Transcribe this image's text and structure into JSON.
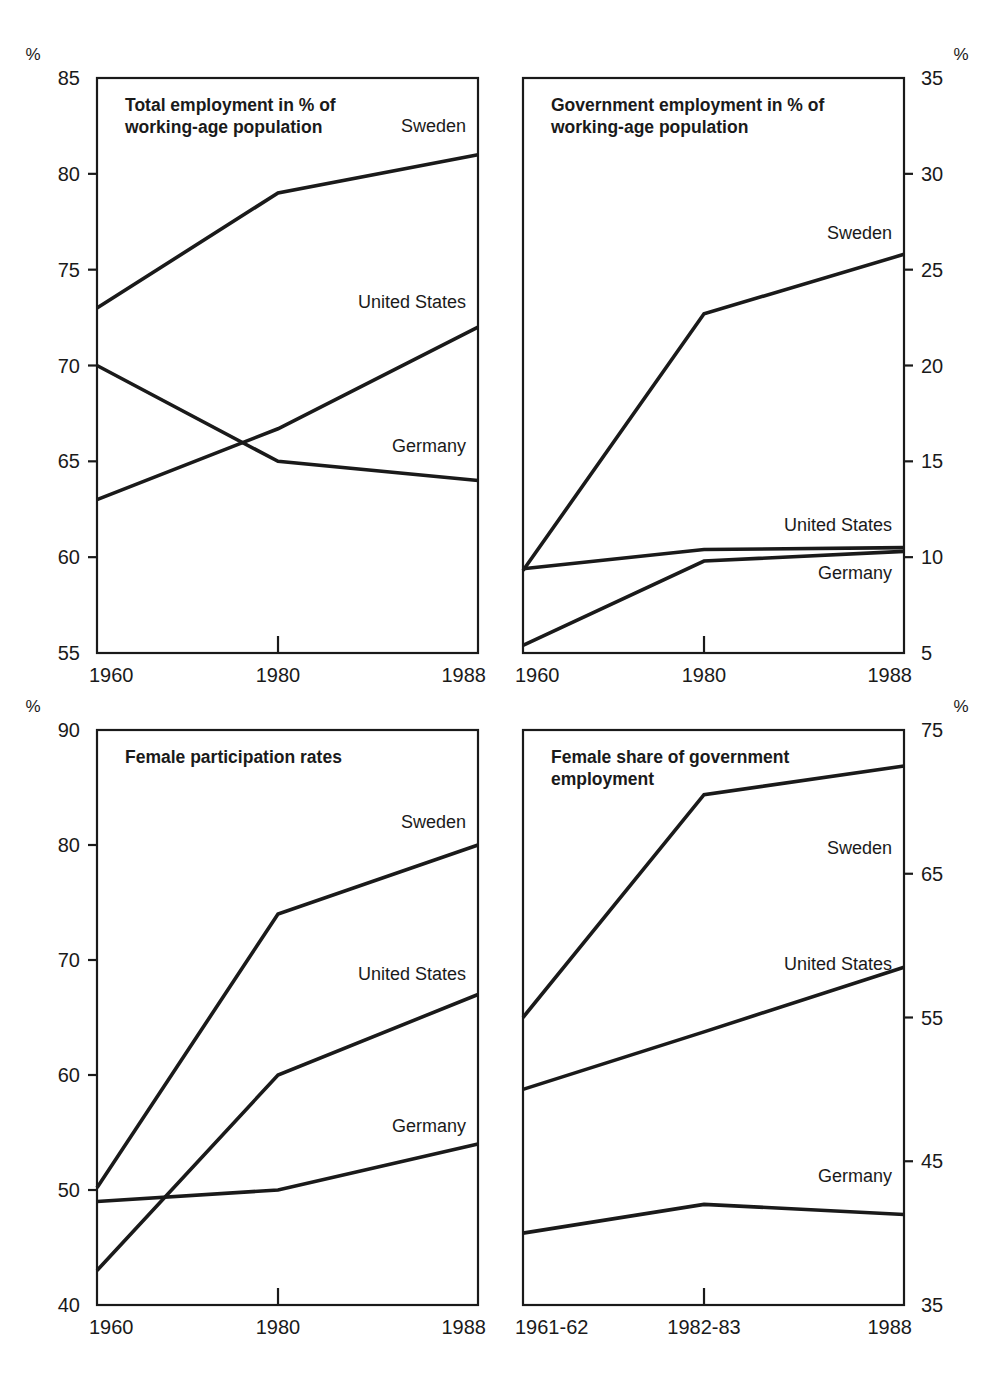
{
  "figure": {
    "series_names": [
      "Sweden",
      "United States",
      "Germany"
    ],
    "unit_symbol": "%",
    "line_color": "#1a1a1a"
  },
  "chart_data": [
    {
      "id": "total-employment",
      "type": "line",
      "title": "Total employment in % of working-age population",
      "title_lines": [
        "Total employment in % of",
        "working-age population"
      ],
      "xlabel": "",
      "ylabel": "%",
      "x": [
        "1960",
        "1980",
        "1988"
      ],
      "xtick_labels": [
        "1960",
        "1980",
        "1988"
      ],
      "ylim": [
        55,
        85
      ],
      "ytick_labels": [
        "55",
        "60",
        "65",
        "70",
        "75",
        "80",
        "85"
      ],
      "yticks": [
        55,
        60,
        65,
        70,
        75,
        80,
        85
      ],
      "grid": false,
      "legend": "inline-right",
      "series": [
        {
          "name": "Sweden",
          "values": [
            73.0,
            79.0,
            81.0
          ],
          "label_anchor_value": 82.5
        },
        {
          "name": "United States",
          "values": [
            63.0,
            66.7,
            72.0
          ],
          "label_anchor_value": 73.3
        },
        {
          "name": "Germany",
          "values": [
            70.0,
            65.0,
            64.0
          ],
          "label_anchor_value": 65.8
        }
      ]
    },
    {
      "id": "government-employment",
      "type": "line",
      "title": "Government employment in % of working-age population",
      "title_lines": [
        "Government employment in % of",
        "working-age population"
      ],
      "xlabel": "",
      "ylabel": "%",
      "x": [
        "1960",
        "1980",
        "1988"
      ],
      "xtick_labels": [
        "1960",
        "1980",
        "1988"
      ],
      "ylim": [
        5,
        35
      ],
      "ytick_labels": [
        "5",
        "10",
        "15",
        "20",
        "25",
        "30",
        "35"
      ],
      "yticks": [
        5,
        10,
        15,
        20,
        25,
        30,
        35
      ],
      "grid": false,
      "legend": "inline-right",
      "series": [
        {
          "name": "Sweden",
          "values": [
            9.3,
            22.7,
            25.8
          ],
          "label_anchor_value": 26.9
        },
        {
          "name": "United States",
          "values": [
            9.4,
            10.4,
            10.5
          ],
          "label_anchor_value": 11.7
        },
        {
          "name": "Germany",
          "values": [
            5.4,
            9.8,
            10.3
          ],
          "label_anchor_value": 9.2
        }
      ]
    },
    {
      "id": "female-participation",
      "type": "line",
      "title": "Female participation rates",
      "title_lines": [
        "Female participation rates"
      ],
      "xlabel": "",
      "ylabel": "%",
      "x": [
        "1960",
        "1980",
        "1988"
      ],
      "xtick_labels": [
        "1960",
        "1980",
        "1988"
      ],
      "ylim": [
        40,
        90
      ],
      "ytick_labels": [
        "40",
        "50",
        "60",
        "70",
        "80",
        "90"
      ],
      "yticks": [
        40,
        50,
        60,
        70,
        80,
        90
      ],
      "grid": false,
      "legend": "inline-right",
      "series": [
        {
          "name": "Sweden",
          "values": [
            50.2,
            74.0,
            80.0
          ],
          "label_anchor_value": 82.0
        },
        {
          "name": "United States",
          "values": [
            43.0,
            60.0,
            67.0
          ],
          "label_anchor_value": 68.8
        },
        {
          "name": "Germany",
          "values": [
            49.0,
            50.0,
            54.0
          ],
          "label_anchor_value": 55.6
        }
      ]
    },
    {
      "id": "female-share-government",
      "type": "line",
      "title": "Female share of government employment",
      "title_lines": [
        "Female share of government",
        "employment"
      ],
      "xlabel": "",
      "ylabel": "%",
      "x": [
        "1961-62",
        "1982-83",
        "1988"
      ],
      "xtick_labels": [
        "1961-62",
        "1982-83",
        "1988"
      ],
      "ylim": [
        35,
        75
      ],
      "ytick_labels": [
        "35",
        "45",
        "55",
        "65",
        "75"
      ],
      "yticks": [
        35,
        45,
        55,
        65,
        75
      ],
      "grid": false,
      "legend": "inline-right",
      "series": [
        {
          "name": "Sweden",
          "values": [
            55.0,
            70.5,
            72.5
          ],
          "label_anchor_value": 66.8
        },
        {
          "name": "United States",
          "values": [
            50.0,
            54.0,
            58.5
          ],
          "label_anchor_value": 58.7
        },
        {
          "name": "Germany",
          "values": [
            40.0,
            42.0,
            41.3
          ],
          "label_anchor_value": 44.0
        }
      ]
    }
  ]
}
